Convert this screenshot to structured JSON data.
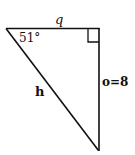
{
  "diagram": {
    "type": "right-triangle",
    "angle_label": "51°",
    "adjacent_label": "q",
    "opposite_label": "o=8",
    "hypotenuse_label": "h",
    "right_angle_marker": true,
    "line_color": "#111111"
  }
}
